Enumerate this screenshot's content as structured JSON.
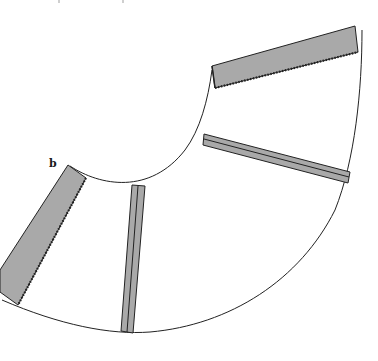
{
  "figure": {
    "label": "b",
    "colors": {
      "background": "#ffffff",
      "outline": "#222222",
      "strip_fill": "#a9a9a9",
      "strip_edge": "#3a3a3a"
    },
    "panel": {
      "inner_arc": "M 68 164 Q 120 200 212 70",
      "outer_arc": "M 4 298 Q 120 345 250 308 Q 350 240 362 30"
    },
    "strips": [
      {
        "name": "top-serged-strip",
        "type": "serged",
        "points": "212,66 355,26 358,52 215,88"
      },
      {
        "name": "left-serged-strip",
        "type": "serged",
        "points": "68,165 86,178 18,305 0,292"
      },
      {
        "name": "right-pressed-seam",
        "type": "pressed",
        "points": "204,134 350,172 348,183 203,145"
      },
      {
        "name": "center-pressed-seam",
        "type": "pressed",
        "points": "132,185 145,186 133,333 121,331"
      }
    ]
  }
}
